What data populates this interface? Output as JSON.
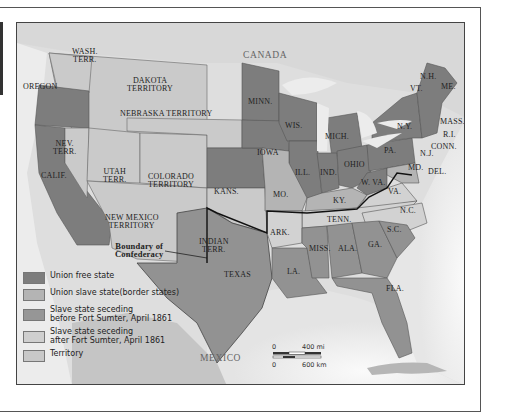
{
  "map": {
    "title_labels": {
      "canada": "CANADA",
      "mexico": "MEXICO"
    },
    "regions": [
      {
        "id": "wash",
        "label": "WASH.\nTERR.",
        "category": "territory"
      },
      {
        "id": "oregon",
        "label": "OREGON",
        "category": "union_free"
      },
      {
        "id": "calif",
        "label": "CALIF.",
        "category": "union_free"
      },
      {
        "id": "nev",
        "label": "NEV.\nTERR.",
        "category": "territory"
      },
      {
        "id": "utah",
        "label": "UTAH\nTERR.",
        "category": "territory"
      },
      {
        "id": "colorado",
        "label": "COLORADO\nTERRITORY",
        "category": "territory"
      },
      {
        "id": "dakota",
        "label": "DAKOTA\nTERRITORY",
        "category": "territory"
      },
      {
        "id": "nebraska",
        "label": "NEBRASKA TERRITORY",
        "category": "territory"
      },
      {
        "id": "newmexico",
        "label": "NEW MEXICO\nTERRITORY",
        "category": "territory"
      },
      {
        "id": "indian",
        "label": "INDIAN\nTERR.",
        "category": "territory"
      },
      {
        "id": "kans",
        "label": "KANS.",
        "category": "union_free"
      },
      {
        "id": "minn",
        "label": "MINN.",
        "category": "union_free"
      },
      {
        "id": "iowa",
        "label": "IOWA",
        "category": "union_free"
      },
      {
        "id": "wis",
        "label": "WIS.",
        "category": "union_free"
      },
      {
        "id": "mich",
        "label": "MICH.",
        "category": "union_free"
      },
      {
        "id": "ill",
        "label": "ILL.",
        "category": "union_free"
      },
      {
        "id": "ind",
        "label": "IND.",
        "category": "union_free"
      },
      {
        "id": "ohio",
        "label": "OHIO",
        "category": "union_free"
      },
      {
        "id": "pa",
        "label": "PA.",
        "category": "union_free"
      },
      {
        "id": "ny",
        "label": "N.Y.",
        "category": "union_free"
      },
      {
        "id": "vt",
        "label": "VT.",
        "category": "union_free"
      },
      {
        "id": "nh",
        "label": "N.H.",
        "category": "union_free"
      },
      {
        "id": "me",
        "label": "ME.",
        "category": "union_free"
      },
      {
        "id": "mass",
        "label": "MASS.",
        "category": "union_free"
      },
      {
        "id": "ri",
        "label": "R.I.",
        "category": "union_free"
      },
      {
        "id": "conn",
        "label": "CONN.",
        "category": "union_free"
      },
      {
        "id": "nj",
        "label": "N.J.",
        "category": "union_free"
      },
      {
        "id": "wva",
        "label": "W. VA.",
        "category": "union_free"
      },
      {
        "id": "mo",
        "label": "MO.",
        "category": "union_slave"
      },
      {
        "id": "ky",
        "label": "KY.",
        "category": "union_slave"
      },
      {
        "id": "md",
        "label": "MD.",
        "category": "union_slave"
      },
      {
        "id": "del",
        "label": "DEL.",
        "category": "union_slave"
      },
      {
        "id": "texas",
        "label": "TEXAS",
        "category": "seceding_before"
      },
      {
        "id": "la",
        "label": "LA.",
        "category": "seceding_before"
      },
      {
        "id": "miss",
        "label": "MISS.",
        "category": "seceding_before"
      },
      {
        "id": "ala",
        "label": "ALA.",
        "category": "seceding_before"
      },
      {
        "id": "ga",
        "label": "GA.",
        "category": "seceding_before"
      },
      {
        "id": "sc",
        "label": "S.C.",
        "category": "seceding_before"
      },
      {
        "id": "fla",
        "label": "FLA.",
        "category": "seceding_before"
      },
      {
        "id": "ark",
        "label": "ARK.",
        "category": "seceding_after"
      },
      {
        "id": "tenn",
        "label": "TENN.",
        "category": "seceding_after"
      },
      {
        "id": "nc",
        "label": "N.C.",
        "category": "seceding_after"
      },
      {
        "id": "va",
        "label": "VA.",
        "category": "seceding_after"
      }
    ],
    "annotation": "Boundary of\nConfederacy"
  },
  "legend": {
    "items": [
      {
        "label": "Union free state",
        "color": "#7d7d7d"
      },
      {
        "label": "Union slave state(border states)",
        "color": "#b4b4b4"
      },
      {
        "label": "Slave state seceding\nbefore Fort Sumter, April 1861",
        "color": "#969696"
      },
      {
        "label": "Slave state seceding\nafter Fort Sumter, April 1861",
        "color": "#cfcfcf"
      },
      {
        "label": "Territory",
        "color": "#c8c8c8"
      }
    ]
  },
  "scale_bar": {
    "mi_zero": "0",
    "mi_label": "400 mi",
    "km_zero": "0",
    "km_label": "600 km"
  },
  "colors": {
    "union_free": "#7d7d7d",
    "union_slave": "#b4b4b4",
    "seceding_before": "#929292",
    "seceding_after": "#d2d2d2",
    "territory": "#cacaca",
    "water": "#ededed",
    "foreign_land": "#bdbdbd"
  }
}
